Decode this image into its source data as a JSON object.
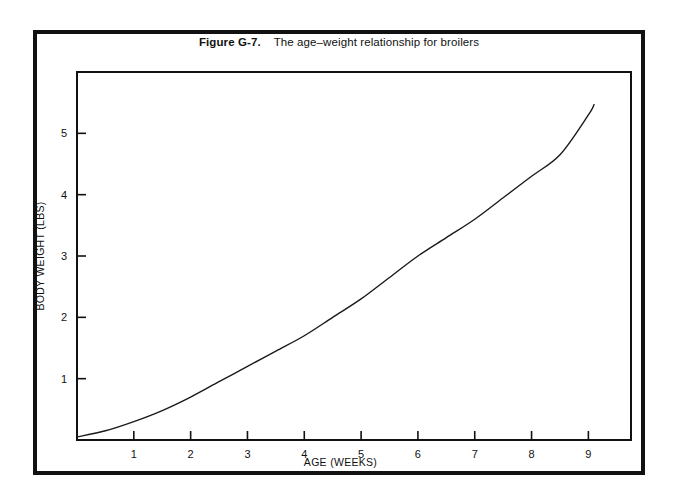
{
  "figure": {
    "label": "Figure G-7.",
    "caption": "The age–weight relationship for broilers"
  },
  "colors": {
    "ink": "#111111",
    "paper": "#ffffff",
    "curve": "#1a1a1a"
  },
  "chart_data": {
    "type": "line",
    "title": "The age–weight relationship for broilers",
    "xlabel": "AGE (WEEKS)",
    "ylabel": "BODY WEIGHT (LBS)",
    "xlim": [
      0,
      9.75
    ],
    "ylim": [
      0,
      6.0
    ],
    "xticks": [
      1,
      2,
      3,
      4,
      5,
      6,
      7,
      8,
      9
    ],
    "xtick_labels": [
      "1",
      "2",
      "3",
      "4",
      "5",
      "6",
      "7",
      "8",
      "9"
    ],
    "yticks": [
      1,
      2,
      3,
      4,
      5
    ],
    "ytick_labels": [
      "1",
      "2",
      "3",
      "4",
      "5"
    ],
    "grid": false,
    "legend": false,
    "series": [
      {
        "name": "Broiler body weight",
        "x": [
          0,
          0.5,
          1,
          1.5,
          2,
          2.5,
          3,
          3.5,
          4,
          4.5,
          5,
          5.5,
          6,
          6.5,
          7,
          7.5,
          8,
          8.5,
          9,
          9.1
        ],
        "y": [
          0.05,
          0.15,
          0.3,
          0.48,
          0.7,
          0.95,
          1.2,
          1.45,
          1.7,
          2.0,
          2.3,
          2.65,
          3.0,
          3.3,
          3.6,
          3.95,
          4.3,
          4.65,
          5.3,
          5.47
        ]
      }
    ]
  }
}
